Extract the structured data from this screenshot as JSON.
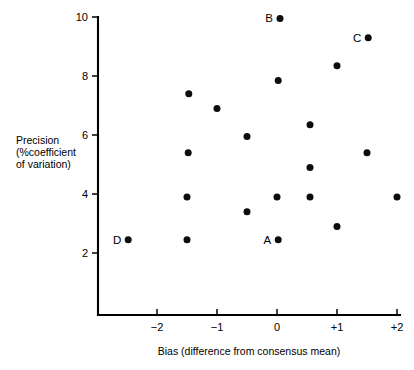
{
  "chart_data": {
    "type": "scatter",
    "title": "",
    "xlabel": "Bias (difference from consensus mean)",
    "ylabel": "Precision (%coefficient of variation)",
    "ylabel_lines": [
      "Precision",
      "(%coefficient",
      "of variation)"
    ],
    "xlim": [
      -2.83,
      2.1
    ],
    "ylim": [
      0,
      10
    ],
    "grid": false,
    "legend": null,
    "xticks": [
      -2,
      -1,
      0,
      1,
      2
    ],
    "xticklabels": [
      "−2",
      "−1",
      "0",
      "+1",
      "+2"
    ],
    "yticks": [
      2,
      4,
      6,
      8,
      10
    ],
    "yticklabels": [
      "2",
      "4",
      "6",
      "8",
      "10"
    ],
    "marker": "filled-circle",
    "marker_color": "#0d0d0d",
    "marker_size_px": 7,
    "points": [
      {
        "x": 0.05,
        "y": 9.95,
        "label": "B"
      },
      {
        "x": 1.52,
        "y": 9.3,
        "label": "C"
      },
      {
        "x": 1.0,
        "y": 8.35,
        "label": ""
      },
      {
        "x": 0.02,
        "y": 7.85,
        "label": ""
      },
      {
        "x": -1.47,
        "y": 7.4,
        "label": ""
      },
      {
        "x": -1.0,
        "y": 6.9,
        "label": ""
      },
      {
        "x": 0.55,
        "y": 6.35,
        "label": ""
      },
      {
        "x": -0.5,
        "y": 5.95,
        "label": ""
      },
      {
        "x": -1.48,
        "y": 5.4,
        "label": ""
      },
      {
        "x": 1.5,
        "y": 5.4,
        "label": ""
      },
      {
        "x": 0.55,
        "y": 4.9,
        "label": ""
      },
      {
        "x": -1.5,
        "y": 3.9,
        "label": ""
      },
      {
        "x": 0.0,
        "y": 3.9,
        "label": ""
      },
      {
        "x": 0.55,
        "y": 3.9,
        "label": ""
      },
      {
        "x": 2.0,
        "y": 3.9,
        "label": ""
      },
      {
        "x": -0.5,
        "y": 3.4,
        "label": ""
      },
      {
        "x": 1.0,
        "y": 2.9,
        "label": ""
      },
      {
        "x": -2.48,
        "y": 2.45,
        "label": "D"
      },
      {
        "x": -1.5,
        "y": 2.45,
        "label": ""
      },
      {
        "x": 0.02,
        "y": 2.45,
        "label": "A"
      }
    ]
  },
  "axes": {
    "x_label": "Bias (difference from consensus mean)",
    "y_label_line1": "Precision",
    "y_label_line2": "(%coefficient",
    "y_label_line3": "of variation)"
  },
  "colors": {
    "background": "#ffffff",
    "axis": "#000000",
    "marker": "#0d0d0d"
  }
}
